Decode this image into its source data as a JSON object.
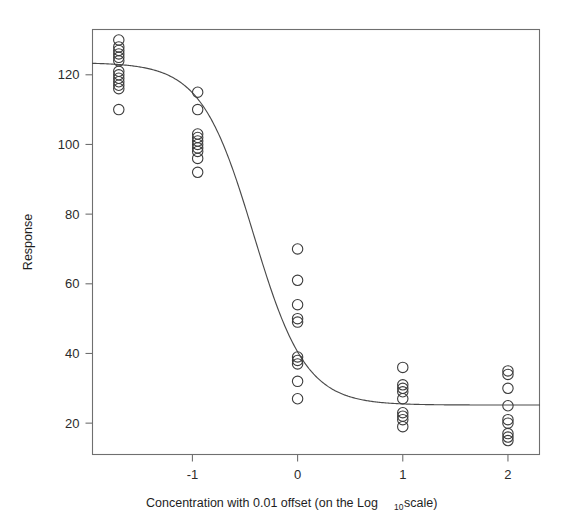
{
  "chart_data": {
    "type": "scatter",
    "title": "",
    "xlabel": "Concentration with 0.01 offset (on the Log10 scale)",
    "xlabel_parts": {
      "before": "Concentration with 0.01 offset (on the Log",
      "subscript": "10",
      "after": " scale)"
    },
    "ylabel": "Response",
    "xlim": [
      -1.95,
      2.3
    ],
    "ylim": [
      11,
      133
    ],
    "xticks": [
      -1,
      0,
      1,
      2
    ],
    "xticklabels": [
      "-1",
      "0",
      "1",
      "2"
    ],
    "yticks": [
      20,
      40,
      60,
      80,
      100,
      120
    ],
    "yticklabels": [
      "20",
      "40",
      "60",
      "80",
      "100",
      "120"
    ],
    "grid": false,
    "legend": false,
    "legend_position": "none",
    "marker": "open-circle",
    "marker_size": 5.2,
    "point_color": "#3d3d3d",
    "curve_color": "#4a4a4a",
    "frame_color": "#6f6f6f",
    "annotations": [],
    "series": [
      {
        "name": "Observed responses",
        "points": [
          {
            "x": -1.7,
            "y": 130
          },
          {
            "x": -1.7,
            "y": 128
          },
          {
            "x": -1.7,
            "y": 127
          },
          {
            "x": -1.7,
            "y": 126
          },
          {
            "x": -1.7,
            "y": 125
          },
          {
            "x": -1.7,
            "y": 124
          },
          {
            "x": -1.7,
            "y": 121
          },
          {
            "x": -1.7,
            "y": 120
          },
          {
            "x": -1.7,
            "y": 119
          },
          {
            "x": -1.7,
            "y": 118
          },
          {
            "x": -1.7,
            "y": 117
          },
          {
            "x": -1.7,
            "y": 116
          },
          {
            "x": -1.7,
            "y": 110
          },
          {
            "x": -0.95,
            "y": 115
          },
          {
            "x": -0.95,
            "y": 110
          },
          {
            "x": -0.95,
            "y": 103
          },
          {
            "x": -0.95,
            "y": 102
          },
          {
            "x": -0.95,
            "y": 101
          },
          {
            "x": -0.95,
            "y": 100
          },
          {
            "x": -0.95,
            "y": 99
          },
          {
            "x": -0.95,
            "y": 98
          },
          {
            "x": -0.95,
            "y": 96
          },
          {
            "x": -0.95,
            "y": 92
          },
          {
            "x": 0.0,
            "y": 70
          },
          {
            "x": 0.0,
            "y": 61
          },
          {
            "x": 0.0,
            "y": 54
          },
          {
            "x": 0.0,
            "y": 50
          },
          {
            "x": 0.0,
            "y": 49
          },
          {
            "x": 0.0,
            "y": 39
          },
          {
            "x": 0.0,
            "y": 38
          },
          {
            "x": 0.0,
            "y": 37
          },
          {
            "x": 0.0,
            "y": 32
          },
          {
            "x": 0.0,
            "y": 27
          },
          {
            "x": 1.0,
            "y": 36
          },
          {
            "x": 1.0,
            "y": 31
          },
          {
            "x": 1.0,
            "y": 30
          },
          {
            "x": 1.0,
            "y": 29
          },
          {
            "x": 1.0,
            "y": 27
          },
          {
            "x": 1.0,
            "y": 23
          },
          {
            "x": 1.0,
            "y": 22
          },
          {
            "x": 1.0,
            "y": 21
          },
          {
            "x": 1.0,
            "y": 19
          },
          {
            "x": 2.0,
            "y": 35
          },
          {
            "x": 2.0,
            "y": 34
          },
          {
            "x": 2.0,
            "y": 30
          },
          {
            "x": 2.0,
            "y": 25
          },
          {
            "x": 2.0,
            "y": 21
          },
          {
            "x": 2.0,
            "y": 20
          },
          {
            "x": 2.0,
            "y": 17
          },
          {
            "x": 2.0,
            "y": 16
          },
          {
            "x": 2.0,
            "y": 15
          }
        ]
      },
      {
        "name": "Fitted four-parameter logistic curve",
        "fit": {
          "upper_asymptote": 123.5,
          "lower_asymptote": 25.2,
          "inflection_x": -0.42,
          "hill_slope": 1.75
        }
      }
    ]
  }
}
